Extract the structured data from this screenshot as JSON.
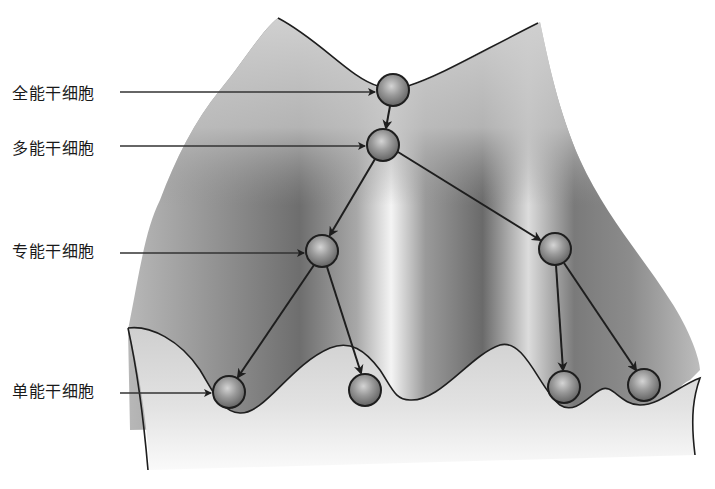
{
  "diagram": {
    "title": "",
    "type": "waddington-landscape",
    "colors": {
      "background": "#ffffff",
      "surface_light": "#d8d8d8",
      "surface_dark": "#6e6e6e",
      "outline": "#1e1e1e",
      "ball_fill": "#8a8a8a",
      "ball_highlight": "#d4d4d4"
    },
    "labels": [
      {
        "id": "totipotent",
        "text": "全能干细胞",
        "y": 95
      },
      {
        "id": "pluripotent",
        "text": "多能干细胞",
        "y": 150
      },
      {
        "id": "multipotent",
        "text": "专能干细胞",
        "y": 253
      },
      {
        "id": "unipotent",
        "text": "单能干细胞",
        "y": 393
      }
    ],
    "nodes": [
      {
        "id": "n1",
        "level": "totipotent",
        "x": 393,
        "y": 90
      },
      {
        "id": "n2",
        "level": "pluripotent",
        "x": 383,
        "y": 145
      },
      {
        "id": "n3",
        "level": "multipotent",
        "x": 322,
        "y": 251
      },
      {
        "id": "n4",
        "level": "multipotent",
        "x": 555,
        "y": 249
      },
      {
        "id": "n5",
        "level": "unipotent",
        "x": 229,
        "y": 392
      },
      {
        "id": "n6",
        "level": "unipotent",
        "x": 365,
        "y": 390
      },
      {
        "id": "n7",
        "level": "unipotent",
        "x": 564,
        "y": 387
      },
      {
        "id": "n8",
        "level": "unipotent",
        "x": 644,
        "y": 385
      }
    ],
    "edges": [
      {
        "from": "n1",
        "to": "n2"
      },
      {
        "from": "n2",
        "to": "n3"
      },
      {
        "from": "n2",
        "to": "n4"
      },
      {
        "from": "n3",
        "to": "n5"
      },
      {
        "from": "n3",
        "to": "n6"
      },
      {
        "from": "n4",
        "to": "n7"
      },
      {
        "from": "n4",
        "to": "n8"
      }
    ]
  }
}
